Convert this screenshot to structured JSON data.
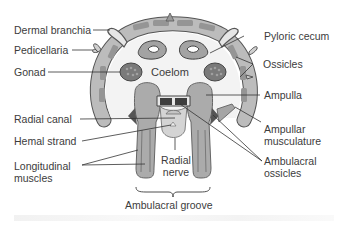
{
  "diagram": {
    "colors": {
      "body_wall": "#b9b9b9",
      "body_wall_outline": "#555555",
      "ossicle_fill": "#8c8c8c",
      "coelom": "#f2f2f2",
      "organ_fill": "#a9a9a9",
      "gonad_fill": "#777777",
      "line": "#3a3a3a",
      "text": "#3c3c3c"
    },
    "labels": {
      "dermal_branchia": "Dermal branchia",
      "pedicellaria": "Pedicellaria",
      "gonad": "Gonad",
      "coelom": "Coelom",
      "pyloric_cecum": "Pyloric cecum",
      "ossicles": "Ossicles",
      "ampulla": "Ampulla",
      "radial_canal": "Radial canal",
      "hemal_strand": "Hemal strand",
      "longitudinal_muscles_1": "Longitudinal",
      "longitudinal_muscles_2": "muscles",
      "radial_nerve_1": "Radial",
      "radial_nerve_2": "nerve",
      "ampullar_musculature_1": "Ampullar",
      "ampullar_musculature_2": "musculature",
      "ambulacral_ossicles_1": "Ambulacral",
      "ambulacral_ossicles_2": "ossicles",
      "ambulacral_groove": "Ambulacral groove"
    }
  }
}
